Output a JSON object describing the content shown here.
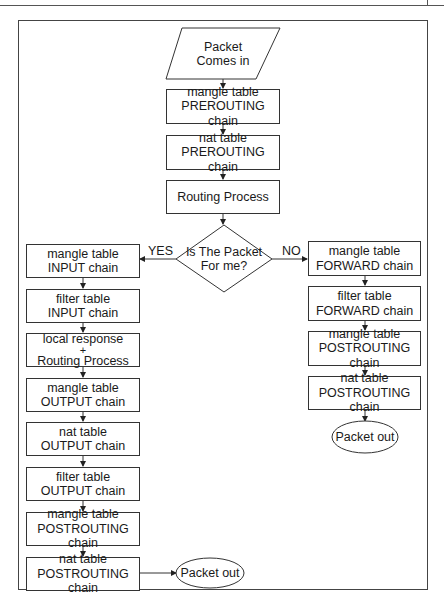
{
  "diagram": {
    "start": {
      "line1": "Packet",
      "line2": "Comes in"
    },
    "main": [
      {
        "line1": "mangle table",
        "line2": "PREROUTING chain"
      },
      {
        "line1": "nat table",
        "line2": "PREROUTING chain"
      },
      {
        "line1": "Routing Process"
      }
    ],
    "decision": {
      "line1": "Is The Packet",
      "line2": "For me?",
      "yes_label": "YES",
      "no_label": "NO"
    },
    "yes_branch": [
      {
        "line1": "mangle table",
        "line2": "INPUT chain"
      },
      {
        "line1": "filter table",
        "line2": "INPUT chain"
      },
      {
        "line1": "local response",
        "plus": "+",
        "line2": "Routing Process"
      },
      {
        "line1": "mangle table",
        "line2": "OUTPUT chain"
      },
      {
        "line1": "nat table",
        "line2": "OUTPUT chain"
      },
      {
        "line1": "filter table",
        "line2": "OUTPUT chain"
      },
      {
        "line1": "mangle table",
        "line2": "POSTROUTING chain"
      },
      {
        "line1": "nat table",
        "line2": "POSTROUTING chain"
      }
    ],
    "yes_end": {
      "label": "Packet out"
    },
    "no_branch": [
      {
        "line1": "mangle table",
        "line2": "FORWARD chain"
      },
      {
        "line1": "filter table",
        "line2": "FORWARD chain"
      },
      {
        "line1": "mangle table",
        "line2": "POSTROUTING chain"
      },
      {
        "line1": "nat table",
        "line2": "POSTROUTING chain"
      }
    ],
    "no_end": {
      "label": "Packet out"
    },
    "colors": {
      "stroke": "#333333",
      "background": "#ffffff",
      "text": "#1a1a1a"
    }
  }
}
